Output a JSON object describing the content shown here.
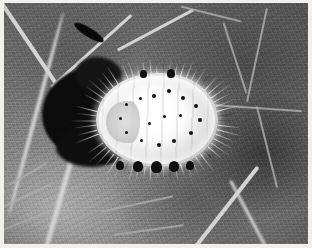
{
  "image": {
    "kind": "macro-photograph",
    "rendering": "grayscale",
    "caption": "",
    "subject": "white waxy mealybug / felt scale insect on a leaf surface",
    "width_px": 312,
    "height_px": 248,
    "border": {
      "present": true,
      "color": "#f2f0ec",
      "width_px": 3
    },
    "palette": {
      "insect_wax_white": "#fdfdfd",
      "insect_body_shadow": "#c2c2c2",
      "insect_pore_dark": "#171717",
      "leaf_midtone": "#6a6a6a",
      "leaf_light": "#9a9a9a",
      "leaf_dark_cell": "#4a4a4a",
      "vein_bright": "#cfcfcf",
      "vein_minor": "#a9a9a9",
      "necrotic_blob_black": "#121212",
      "frame_paper": "#f2f0ec"
    },
    "regions": [
      {
        "name": "insect",
        "label": "white oval insect with radiating marginal wax filaments",
        "x": 80,
        "y": 58,
        "w": 146,
        "h": 118
      },
      {
        "name": "necrotic-blob",
        "label": "dark irregular blotch left of the insect",
        "x": 38,
        "y": 64,
        "w": 92,
        "h": 92
      },
      {
        "name": "leaf-upper-left",
        "label": "mid-gray leaf lamina with converging veins",
        "x": 0,
        "y": 0,
        "w": 150,
        "h": 90
      },
      {
        "name": "leaf-upper-right",
        "label": "darker leaf lamina with polygonal vein network",
        "x": 190,
        "y": 0,
        "w": 122,
        "h": 110
      },
      {
        "name": "leaf-lower-left",
        "label": "lighter leaf panel behind a bright curved vein",
        "x": 0,
        "y": 150,
        "w": 110,
        "h": 98
      },
      {
        "name": "leaf-lower-right",
        "label": "darker leaf cells crossed by a bright diagonal vein",
        "x": 170,
        "y": 150,
        "w": 142,
        "h": 98
      }
    ],
    "insect_features": {
      "marginal_filament_count": 64,
      "dorsal_pore_count": 16,
      "ventral_notch_count": 7,
      "body_outline": "broad oval, rounded at both poles, segmented transversely"
    },
    "veins": [
      {
        "name": "vein-upper-left-diagonal",
        "brightness": "bright"
      },
      {
        "name": "vein-upper-right-diagonal",
        "brightness": "bright"
      },
      {
        "name": "vein-left-curved-margin",
        "brightness": "bright"
      },
      {
        "name": "vein-lower-right-diagonal",
        "brightness": "bright"
      },
      {
        "name": "vein-network-right",
        "brightness": "minor"
      }
    ]
  }
}
